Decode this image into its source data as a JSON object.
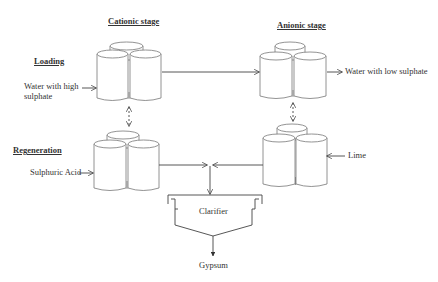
{
  "headings": {
    "cationic": "Cationic stage",
    "anionic": "Anionic stage",
    "loading": "Loading",
    "regeneration": "Regeneration"
  },
  "labels": {
    "water_high_line1": "Water with high",
    "water_high_line2": "sulphate",
    "water_low": "Water with low sulphate",
    "sulphuric_acid": "Sulphuric Acid",
    "lime": "Lime",
    "clarifier": "Clarifier",
    "gypsum": "Gypsum"
  },
  "colors": {
    "stroke": "#555555",
    "text": "#333333"
  }
}
